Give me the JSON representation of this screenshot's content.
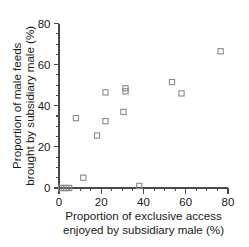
{
  "chart_data": {
    "type": "scatter",
    "title": "",
    "xlabel": "Proportion of exclusive access enjoyed by subsidiary male (%)",
    "xlabel_line1": "Proportion of exclusive access",
    "xlabel_line2": "enjoyed by subsidiary male (%)",
    "ylabel": "Proportion of male feeds brought by subsidiary male (%)",
    "ylabel_line1": "Proportion of male feeds",
    "ylabel_line2": "brought by subsidiary male (%)",
    "xlim": [
      0,
      80
    ],
    "ylim": [
      0,
      80
    ],
    "xticks": [
      0,
      20,
      40,
      60,
      80
    ],
    "yticks": [
      0,
      20,
      40,
      60,
      80
    ],
    "xtick_labels": [
      "0",
      "20",
      "40",
      "60",
      "80"
    ],
    "ytick_labels": [
      "0",
      "20",
      "40",
      "60",
      "80"
    ],
    "xminor_step": 5,
    "yminor_step": 5,
    "grid": false,
    "legend": null,
    "marker": "open-square",
    "marker_color": "#8a8a8a",
    "series": [
      {
        "name": "subsidiary male",
        "points": [
          {
            "x": 1.0,
            "y": 0.0
          },
          {
            "x": 2.2,
            "y": 0.0
          },
          {
            "x": 3.4,
            "y": 0.0
          },
          {
            "x": 4.8,
            "y": 0.0
          },
          {
            "x": 8.0,
            "y": 34.0
          },
          {
            "x": 11.5,
            "y": 5.0
          },
          {
            "x": 18.0,
            "y": 25.5
          },
          {
            "x": 22.0,
            "y": 32.5
          },
          {
            "x": 22.0,
            "y": 46.5
          },
          {
            "x": 30.5,
            "y": 37.0
          },
          {
            "x": 31.5,
            "y": 47.0
          },
          {
            "x": 31.5,
            "y": 48.5
          },
          {
            "x": 38.0,
            "y": 1.0
          },
          {
            "x": 53.5,
            "y": 51.5
          },
          {
            "x": 58.0,
            "y": 46.0
          },
          {
            "x": 76.5,
            "y": 66.5
          }
        ]
      }
    ]
  },
  "axes": {
    "y_title_line1": "Proportion of male feeds",
    "y_title_line2": "brought by subsidiary male (%)",
    "x_title_line1": "Proportion of exclusive access",
    "x_title_line2": "enjoyed by subsidiary male (%)"
  }
}
